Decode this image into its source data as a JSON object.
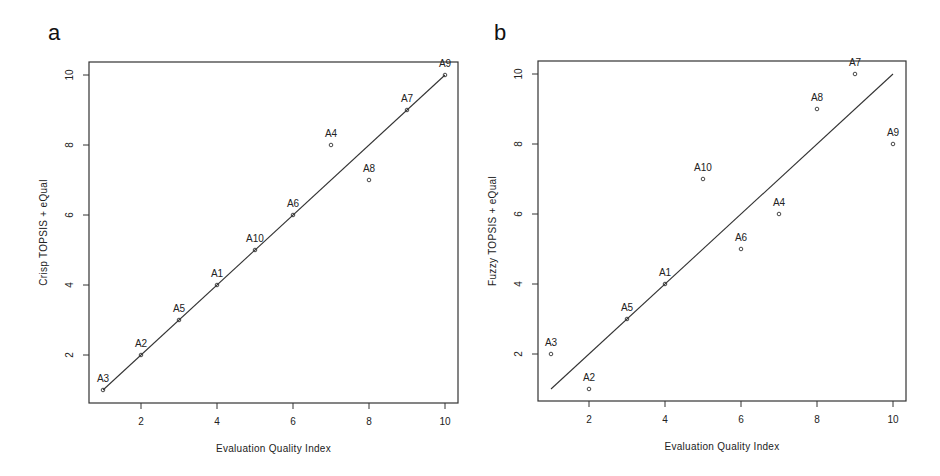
{
  "chart_data": [
    {
      "panel": "a",
      "type": "scatter",
      "title": "",
      "xlabel": "Evaluation Quality Index",
      "ylabel": "Crisp TOPSIS + eQual",
      "xlim": [
        0.7,
        10.3
      ],
      "ylim": [
        0.6,
        10.4
      ],
      "xticks": [
        2,
        4,
        6,
        8,
        10
      ],
      "yticks": [
        2,
        4,
        6,
        8,
        10
      ],
      "grid": false,
      "reference_line": {
        "from": [
          1,
          1
        ],
        "to": [
          10,
          10
        ]
      },
      "points": [
        {
          "label": "A3",
          "x": 1,
          "y": 1
        },
        {
          "label": "A2",
          "x": 2,
          "y": 2
        },
        {
          "label": "A5",
          "x": 3,
          "y": 3
        },
        {
          "label": "A1",
          "x": 4,
          "y": 4
        },
        {
          "label": "A10",
          "x": 5,
          "y": 5
        },
        {
          "label": "A6",
          "x": 6,
          "y": 6
        },
        {
          "label": "A4",
          "x": 7,
          "y": 8
        },
        {
          "label": "A8",
          "x": 8,
          "y": 7
        },
        {
          "label": "A7",
          "x": 9,
          "y": 9
        },
        {
          "label": "A9",
          "x": 10,
          "y": 10
        }
      ]
    },
    {
      "panel": "b",
      "type": "scatter",
      "title": "",
      "xlabel": "Evaluation Quality Index",
      "ylabel": "Fuzzy TOPSIS + eQual",
      "xlim": [
        0.7,
        10.3
      ],
      "ylim": [
        0.6,
        10.4
      ],
      "xticks": [
        2,
        4,
        6,
        8,
        10
      ],
      "yticks": [
        2,
        4,
        6,
        8,
        10
      ],
      "grid": false,
      "reference_line": {
        "from": [
          1,
          1
        ],
        "to": [
          10,
          10
        ]
      },
      "points": [
        {
          "label": "A3",
          "x": 1,
          "y": 2
        },
        {
          "label": "A2",
          "x": 2,
          "y": 1
        },
        {
          "label": "A5",
          "x": 3,
          "y": 3
        },
        {
          "label": "A1",
          "x": 4,
          "y": 4
        },
        {
          "label": "A10",
          "x": 5,
          "y": 7
        },
        {
          "label": "A6",
          "x": 6,
          "y": 5
        },
        {
          "label": "A4",
          "x": 7,
          "y": 6
        },
        {
          "label": "A8",
          "x": 8,
          "y": 9
        },
        {
          "label": "A7",
          "x": 9,
          "y": 10
        },
        {
          "label": "A9",
          "x": 10,
          "y": 8
        }
      ]
    }
  ],
  "panels": {
    "a": {
      "label": "a"
    },
    "b": {
      "label": "b"
    }
  }
}
